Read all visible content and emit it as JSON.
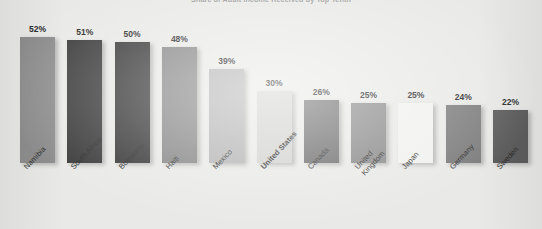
{
  "chart_data": {
    "type": "bar",
    "title": "Share of Adult Income Received by Top Tenth",
    "subtitle": "",
    "xlabel": "",
    "ylabel": "",
    "ylim": [
      0,
      60
    ],
    "grid": false,
    "legend": "none",
    "value_suffix": "%",
    "highlight_category": "United States",
    "categories": [
      "Namibia",
      "South Africa",
      "Botswana",
      "Haiti",
      "Mexico",
      "United States",
      "Canada",
      "United Kingdom",
      "Japan",
      "Germany",
      "Sweden"
    ],
    "values": [
      52,
      51,
      50,
      48,
      39,
      30,
      26,
      25,
      25,
      24,
      22
    ],
    "value_labels": [
      "52%",
      "51%",
      "50%",
      "48%",
      "39%",
      "30%",
      "26%",
      "25%",
      "25%",
      "24%",
      "22%"
    ],
    "bar_colors": [
      "#8e8e8e",
      "#3d3d3d",
      "#3a3a3a",
      "#868686",
      "#b4b4b4",
      "#d2d2d0",
      "#6e6e6e",
      "#8a8a8a",
      "#f1f1ef",
      "#7d7d7d",
      "#5d5d5d"
    ],
    "background_color": "#e9e9e7"
  }
}
